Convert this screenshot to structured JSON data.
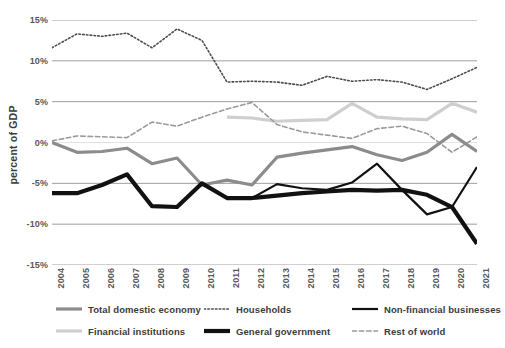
{
  "axis": {
    "ylabel": "percent of GDP",
    "yticks": [
      "15%",
      "10%",
      "5%",
      "0%",
      "-5%",
      "-10%",
      "-15%"
    ]
  },
  "legend": {
    "items": [
      {
        "label": "Total domestic economy",
        "style": "solid-thick",
        "color": "#8c8c8c"
      },
      {
        "label": "Households",
        "style": "dotted",
        "color": "#4d4d4d"
      },
      {
        "label": "Non-financial businesses",
        "style": "solid",
        "color": "#111111"
      },
      {
        "label": "Financial institutions",
        "style": "solid-thick",
        "color": "#cfcfcf"
      },
      {
        "label": "General government",
        "style": "solid-xthick",
        "color": "#111111"
      },
      {
        "label": "Rest of world",
        "style": "dashed",
        "color": "#9a9a9a"
      }
    ]
  },
  "chart_data": {
    "type": "line",
    "title": "",
    "xlabel": "",
    "ylabel": "percent of GDP",
    "ylim": [
      -15,
      15
    ],
    "ytick_values": [
      15,
      10,
      5,
      0,
      -5,
      -10,
      -15
    ],
    "grid": "horizontal",
    "legend_position": "bottom",
    "categories": [
      2004,
      2005,
      2006,
      2007,
      2008,
      2009,
      2010,
      2011,
      2012,
      2013,
      2014,
      2015,
      2016,
      2017,
      2018,
      2019,
      2020,
      2021
    ],
    "series": [
      {
        "name": "Total domestic economy",
        "color": "#8c8c8c",
        "style": "solid-thick",
        "values": [
          0.0,
          -1.2,
          -1.1,
          -0.7,
          -2.6,
          -1.9,
          -5.2,
          -4.6,
          -5.2,
          -1.8,
          -1.3,
          -0.9,
          -0.5,
          -1.5,
          -2.2,
          -1.2,
          1.0,
          -1.1
        ]
      },
      {
        "name": "Households",
        "color": "#4d4d4d",
        "style": "dotted",
        "values": [
          11.6,
          13.3,
          13.0,
          13.4,
          11.6,
          13.9,
          12.5,
          7.4,
          7.5,
          7.4,
          7.0,
          8.1,
          7.5,
          7.7,
          7.4,
          6.5,
          7.8,
          9.2
        ]
      },
      {
        "name": "Non-financial businesses",
        "color": "#111111",
        "style": "solid",
        "values": [
          -6.2,
          -6.2,
          -5.2,
          -3.9,
          -7.8,
          -7.9,
          -5.0,
          -6.8,
          -6.8,
          -5.1,
          -5.6,
          -5.8,
          -4.9,
          -2.6,
          -5.8,
          -8.8,
          -7.9,
          -3.0
        ]
      },
      {
        "name": "Financial institutions",
        "color": "#cfcfcf",
        "style": "solid-thick",
        "values": [
          null,
          null,
          null,
          null,
          null,
          null,
          null,
          3.1,
          3.0,
          2.6,
          2.7,
          2.8,
          4.8,
          3.1,
          2.9,
          2.8,
          4.8,
          3.7
        ]
      },
      {
        "name": "General government",
        "color": "#111111",
        "style": "solid-xthick",
        "values": [
          -6.2,
          -6.2,
          -5.2,
          -3.9,
          -7.8,
          -7.9,
          -5.0,
          -6.8,
          -6.8,
          -6.5,
          -6.2,
          -6.0,
          -5.8,
          -5.9,
          -5.8,
          -6.4,
          -7.9,
          -12.4
        ]
      },
      {
        "name": "Rest of world",
        "color": "#9a9a9a",
        "style": "dashed",
        "values": [
          0.2,
          0.8,
          0.7,
          0.6,
          2.5,
          2.0,
          3.1,
          4.1,
          4.9,
          2.2,
          1.3,
          0.9,
          0.5,
          1.7,
          2.0,
          1.1,
          -1.2,
          0.7
        ]
      }
    ]
  }
}
